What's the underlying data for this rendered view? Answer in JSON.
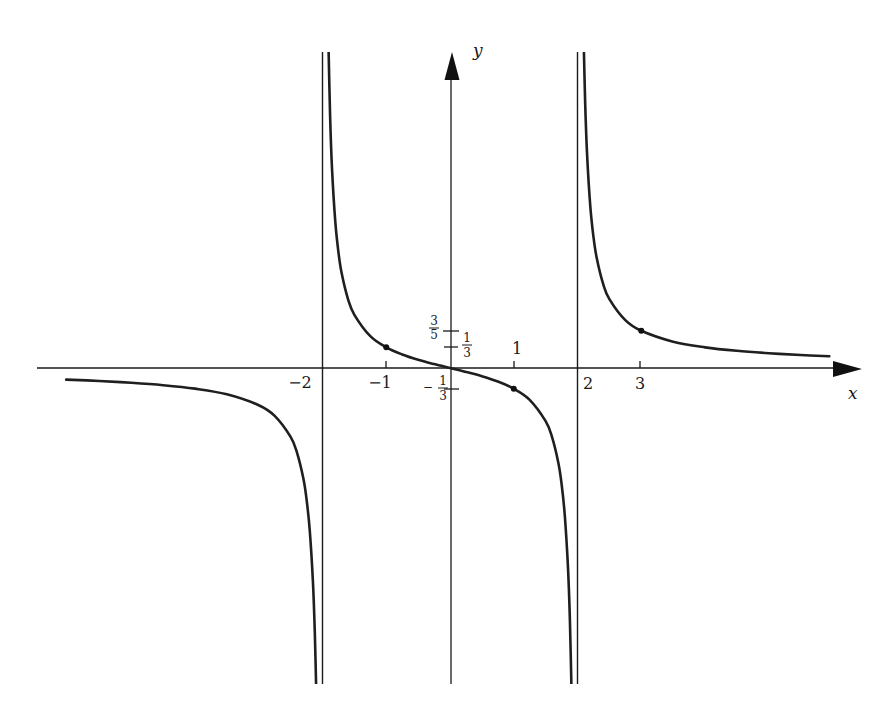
{
  "chart_data": {
    "type": "line",
    "title": "",
    "function": "y = x / (x^2 - 4)",
    "xlabel": "x",
    "ylabel": "y",
    "grid": false,
    "legend": null,
    "xlim": [
      -6.2,
      6.4
    ],
    "ylim": [
      -5.1,
      5.1
    ],
    "asymptotes": {
      "vertical": [
        -2,
        2
      ],
      "horizontal": [
        0
      ]
    },
    "x_ticks": [
      {
        "value": -2,
        "label": "−2"
      },
      {
        "value": -1,
        "label": "−1"
      },
      {
        "value": 1,
        "label": "1"
      },
      {
        "value": 2,
        "label": "2"
      },
      {
        "value": 3,
        "label": "3"
      }
    ],
    "y_ticks": [
      {
        "value": 0.6,
        "label": "3/5",
        "sign": "",
        "numerator": "3",
        "denominator": "5"
      },
      {
        "value": 0.3333,
        "label": "1/3",
        "sign": "",
        "numerator": "1",
        "denominator": "3"
      },
      {
        "value": -0.3333,
        "label": "−1/3",
        "sign": "−",
        "numerator": "1",
        "denominator": "3"
      }
    ],
    "marked_points": [
      {
        "x": -1,
        "y": 0.3333
      },
      {
        "x": 1,
        "y": -0.3333
      },
      {
        "x": 3,
        "y": 0.6
      }
    ],
    "series": [
      {
        "name": "left branch (x < -2)",
        "x": [
          -6.02,
          -5.5,
          -5,
          -4.5,
          -4,
          -3.5,
          -3,
          -2.75,
          -2.5,
          -2.4,
          -2.3,
          -2.25,
          -2.2,
          -2.15,
          -2.12,
          -2.097
        ],
        "y": [
          -0.1867,
          -0.2095,
          -0.2381,
          -0.2769,
          -0.3333,
          -0.4242,
          -0.6,
          -0.7719,
          -1.1111,
          -1.3636,
          -1.7829,
          -2.1176,
          -2.619,
          -3.4538,
          -4.288,
          -5.2768
        ]
      },
      {
        "name": "middle branch (-2 < x < 2)",
        "x": [
          -1.907,
          -1.88,
          -1.85,
          -1.8,
          -1.75,
          -1.7,
          -1.6,
          -1.5,
          -1.25,
          -1,
          -0.75,
          -0.5,
          -0.25,
          0,
          0.25,
          0.5,
          0.75,
          1,
          1.25,
          1.5,
          1.6,
          1.7,
          1.75,
          1.8,
          1.85,
          1.88,
          1.907
        ],
        "y": [
          5.2476,
          4.0378,
          3.2035,
          2.3684,
          1.8667,
          1.5315,
          1.1111,
          0.8571,
          0.5128,
          0.3333,
          0.2182,
          0.1333,
          0.0635,
          0,
          -0.0635,
          -0.1333,
          -0.2182,
          -0.3333,
          -0.5128,
          -0.8571,
          -1.1111,
          -1.5315,
          -1.8667,
          -2.3684,
          -3.2035,
          -4.0378,
          -5.2476
        ]
      },
      {
        "name": "right branch (x > 2)",
        "x": [
          2.097,
          2.12,
          2.15,
          2.2,
          2.25,
          2.3,
          2.4,
          2.5,
          2.75,
          3,
          3.5,
          4,
          4.5,
          5,
          5.5,
          5.95
        ],
        "y": [
          5.2768,
          4.288,
          3.4538,
          2.619,
          2.1176,
          1.7829,
          1.3636,
          1.1111,
          0.7719,
          0.6,
          0.4242,
          0.3333,
          0.2769,
          0.2381,
          0.2095,
          0.1895
        ]
      }
    ]
  }
}
